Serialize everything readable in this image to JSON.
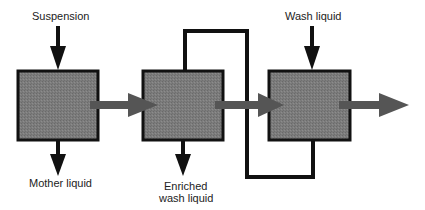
{
  "diagram": {
    "type": "process-flow",
    "colors": {
      "box_fill": "#7a7a7a",
      "box_stroke": "#111111",
      "flow_arrow": "#555555",
      "line": "#111111",
      "background": "#ffffff"
    },
    "nodes": [
      {
        "id": "stage-1",
        "label": ""
      },
      {
        "id": "stage-2",
        "label": ""
      },
      {
        "id": "stage-3",
        "label": ""
      }
    ],
    "labels": {
      "suspension": "Suspension",
      "mother_liquid": "Mother liquid",
      "enriched_line1": "Enriched",
      "enriched_line2": "wash liquid",
      "wash_liquid": "Wash liquid"
    },
    "edges": [
      {
        "from": "Suspension",
        "to": "stage-1",
        "style": "black-arrow"
      },
      {
        "from": "stage-1",
        "to": "Mother liquid",
        "style": "black-arrow"
      },
      {
        "from": "stage-1",
        "to": "stage-2",
        "style": "gray-flow-arrow"
      },
      {
        "from": "stage-2",
        "to": "Enriched wash liquid",
        "style": "black-arrow"
      },
      {
        "from": "stage-2",
        "to": "stage-3",
        "style": "gray-flow-arrow"
      },
      {
        "from": "Wash liquid",
        "to": "stage-3",
        "style": "black-arrow"
      },
      {
        "from": "stage-3",
        "to": "stage-2",
        "style": "black-line-loop-bottom"
      },
      {
        "from": "stage-3",
        "to": "out",
        "style": "gray-flow-arrow"
      }
    ]
  }
}
